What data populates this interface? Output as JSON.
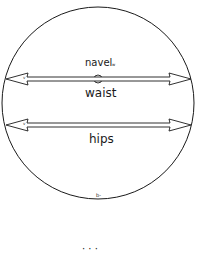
{
  "diagram": {
    "shape": "circle",
    "labels": {
      "navel": "navel",
      "navel_sub": "w",
      "waist": "waist",
      "hips": "hips",
      "bottom_mark": "b-",
      "waist_arrow_mark": "v",
      "hips_arrow_mark": "v",
      "caption_partial": "·  ·  ·"
    },
    "arrows": [
      {
        "name": "waist",
        "direction": "double-headed horizontal"
      },
      {
        "name": "hips",
        "direction": "double-headed horizontal"
      }
    ],
    "colors": {
      "stroke": "#1a1a1a",
      "background": "#ffffff"
    }
  }
}
